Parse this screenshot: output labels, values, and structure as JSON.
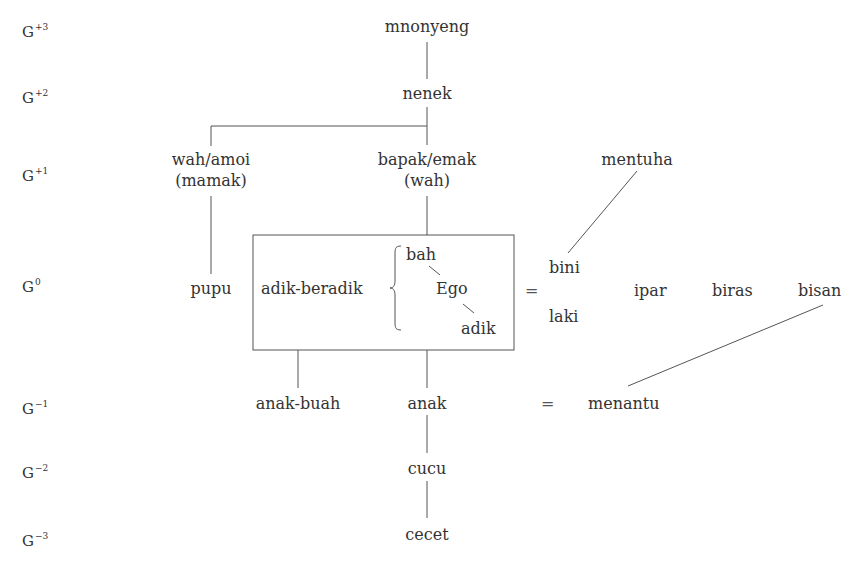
{
  "generations": [
    {
      "base": "G",
      "sup": "+3"
    },
    {
      "base": "G",
      "sup": "+2"
    },
    {
      "base": "G",
      "sup": "+1"
    },
    {
      "base": "G",
      "sup": "0"
    },
    {
      "base": "G",
      "sup": "−1"
    },
    {
      "base": "G",
      "sup": "−2"
    },
    {
      "base": "G",
      "sup": "−3"
    }
  ],
  "terms": {
    "g3": "mnonyeng",
    "g2": "nenek",
    "g1_left_line1": "wah/amoi",
    "g1_left_line2": "(mamak)",
    "g1_center_line1": "bapak/emak",
    "g1_center_line2": "(wah)",
    "g1_right": "mentuha",
    "g0_pupu": "pupu",
    "g0_siblings": "adik-beradik",
    "g0_elder": "bah",
    "g0_ego": "Ego",
    "g0_younger": "adik",
    "g0_equals": "=",
    "g0_wife": "bini",
    "g0_husband": "laki",
    "g0_ipar": "ipar",
    "g0_biras": "biras",
    "g0_bisan": "bisan",
    "gm1_anak_buah": "anak-buah",
    "gm1_anak": "anak",
    "gm1_equals": "=",
    "gm1_menantu": "menantu",
    "gm2": "cucu",
    "gm3": "cecet"
  }
}
